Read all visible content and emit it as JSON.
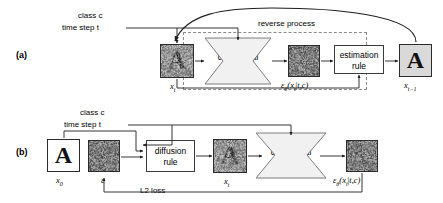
{
  "figure": {
    "panels": [
      {
        "id": "(a)",
        "name": "reverse-process-panel",
        "process_label": "reverse process",
        "conditioning": {
          "class_label": "class c",
          "timestep_label": "time step t"
        },
        "blocks": [
          {
            "name": "unet",
            "line1": "conditional",
            "line2": "U-Net θ",
            "shape": "hourglass"
          },
          {
            "name": "estimation-rule",
            "line1": "estimation",
            "line2": "rule",
            "shape": "rect"
          }
        ],
        "images": [
          {
            "name": "x-t-noisy",
            "caption": "x_t",
            "kind": "noisy-letter-A"
          },
          {
            "name": "epsilon-prediction",
            "caption": "ε_θ(x_t|t,c)",
            "kind": "pure-noise"
          },
          {
            "name": "x-t-minus-1",
            "caption": "x_{t-1}",
            "kind": "clean-letter-A"
          }
        ]
      },
      {
        "id": "(b)",
        "name": "training-panel",
        "process_label": "L2 loss",
        "conditioning": {
          "class_label": "class c",
          "timestep_label": "time step t"
        },
        "blocks": [
          {
            "name": "diffusion-rule",
            "line1": "diffusion",
            "line2": "rule",
            "shape": "rect"
          },
          {
            "name": "unet",
            "line1": "conditional",
            "line2": "U-Net θ",
            "shape": "hourglass"
          }
        ],
        "images": [
          {
            "name": "x-0-clean",
            "caption": "x_0",
            "kind": "clean-letter-A-white"
          },
          {
            "name": "epsilon-noise",
            "caption": "ε",
            "kind": "pure-noise"
          },
          {
            "name": "x-t-noisy",
            "caption": "x_t",
            "kind": "noisy-letter-A"
          },
          {
            "name": "epsilon-prediction",
            "caption": "ε_θ(x_t|t,c)",
            "kind": "pure-noise"
          }
        ]
      }
    ],
    "letter": "A",
    "colors": {
      "stroke": "#2b2b2b",
      "dashed_boundary": "#8a8a8a",
      "unet_fill": "#f1f1f1",
      "noise_dark": "#6e6e6e",
      "noise_light": "#b9b9b9",
      "background": "#ffffff"
    }
  }
}
